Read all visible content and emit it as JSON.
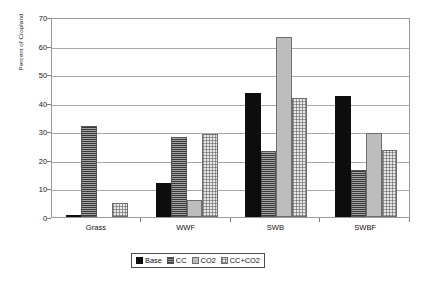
{
  "chart_data": {
    "type": "bar",
    "title": "",
    "xlabel": "",
    "ylabel": "Percent of Cropland",
    "categories": [
      "Grass",
      "WWF",
      "SWB",
      "SWBF"
    ],
    "series": [
      {
        "name": "Base",
        "values": [
          0.5,
          12,
          43.5,
          42.5
        ]
      },
      {
        "name": "CC",
        "values": [
          32,
          28,
          23,
          16.5
        ]
      },
      {
        "name": "CO2",
        "values": [
          0,
          6,
          63,
          29.5
        ]
      },
      {
        "name": "CC+CO2",
        "values": [
          5,
          29,
          41.5,
          23.5
        ]
      }
    ],
    "ylim": [
      0,
      70
    ],
    "yticks": [
      0,
      10,
      20,
      30,
      40,
      50,
      60,
      70
    ],
    "ytick_labels": [
      "0",
      "10",
      "20",
      "30",
      "40",
      "50",
      "60",
      "70"
    ],
    "grid": true,
    "legend_position": "bottom",
    "legend": [
      "Base",
      "CC",
      "CO2",
      "CC+CO2"
    ],
    "colors": {
      "Base": "#0d0d0d",
      "CC": "#7c7c7c",
      "CO2": "#bdbdbd",
      "CC+CO2": "#e8e8e8",
      "gridline": "#a8a8a8",
      "frame": "#9a9a9a",
      "text": "#111111"
    }
  }
}
